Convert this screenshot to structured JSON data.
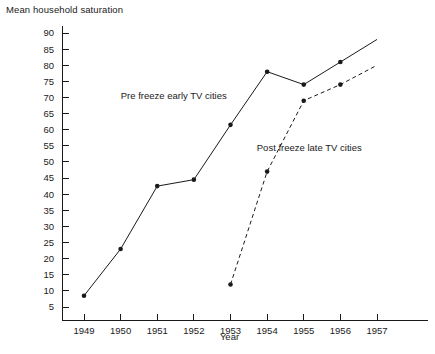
{
  "chart_data": {
    "type": "line",
    "title": "",
    "xlabel": "Year",
    "ylabel": "Mean household saturation",
    "x": [
      1949,
      1950,
      1951,
      1952,
      1953,
      1954,
      1955,
      1956,
      1957
    ],
    "xticklabels": [
      "1949",
      "1950",
      "1951",
      "1952",
      "1953",
      "1954",
      "1955",
      "1956",
      "1957"
    ],
    "yticklabels": [
      "5",
      "10",
      "15",
      "20",
      "25",
      "30",
      "35",
      "40",
      "45",
      "50",
      "55",
      "60",
      "65",
      "70",
      "75",
      "80",
      "85",
      "90"
    ],
    "yticks": [
      5,
      10,
      15,
      20,
      25,
      30,
      35,
      40,
      45,
      50,
      55,
      60,
      65,
      70,
      75,
      80,
      85,
      90
    ],
    "ylim": [
      0,
      92
    ],
    "xlim": [
      1948.3,
      1957.9
    ],
    "grid": false,
    "legend": "annotations-inline",
    "series": [
      {
        "name": "Pre freeze early TV cities",
        "style": "solid",
        "marker": "filled-circle",
        "x": [
          1949,
          1950,
          1951,
          1952,
          1953,
          1954,
          1955,
          1956,
          1957
        ],
        "values": [
          8.5,
          23,
          42.5,
          44.5,
          61.5,
          78,
          74,
          81,
          88
        ],
        "markers_shown": [
          true,
          true,
          true,
          true,
          true,
          true,
          true,
          true,
          false
        ]
      },
      {
        "name": "Post freeze late TV cities",
        "style": "dashed",
        "marker": "filled-circle",
        "x": [
          1953,
          1954,
          1955,
          1956,
          1957
        ],
        "values": [
          12,
          47,
          69,
          74,
          80
        ],
        "markers_shown": [
          true,
          true,
          true,
          true,
          false
        ]
      }
    ],
    "annotations": [
      {
        "text": "Pre freeze early TV cities",
        "x": 1951.45,
        "y": 69.5
      },
      {
        "text": "Post freeze late TV cities",
        "x": 1955.15,
        "y": 53.5
      }
    ]
  },
  "axis": {
    "y_title": "Mean household saturation",
    "x_title": "Year"
  }
}
